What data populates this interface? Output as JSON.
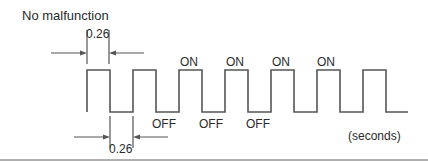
{
  "title": "No malfunction",
  "dimensions": {
    "top_width": "0.26",
    "bottom_width": "0.26"
  },
  "states": {
    "on_labels": [
      "ON",
      "ON",
      "ON",
      "ON"
    ],
    "off_labels": [
      "OFF",
      "OFF",
      "OFF"
    ]
  },
  "unit_label": "(seconds)",
  "waveform": {
    "description": "Square wave signal, ON/OFF alternating every 0.26 seconds",
    "pulse_count": 7,
    "on_duration_s": 0.26,
    "off_duration_s": 0.26
  },
  "colors": {
    "line": "#555555",
    "text": "#2a2a2a",
    "footer_rule": "#b0b0b0"
  }
}
